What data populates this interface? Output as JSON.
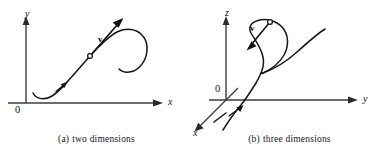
{
  "figure": {
    "background_color": "#ffffff",
    "ink_color": "#1a1a1a",
    "axis_color": "#3a3a3a"
  },
  "panels": [
    {
      "id": "two-dimensions",
      "caption_tag": "(a)",
      "caption_text": "two dimensions",
      "axes": [
        {
          "name": "y-axis",
          "label": "y"
        },
        {
          "name": "x-axis",
          "label": "x"
        }
      ],
      "origin_label": "0",
      "vector_label": "v",
      "point_marker": "open-circle",
      "curve_description": "space curve with tangent vector"
    },
    {
      "id": "three-dimensions",
      "caption_tag": "(b)",
      "caption_text": "three dimensions",
      "axes": [
        {
          "name": "z-axis",
          "label": "z"
        },
        {
          "name": "y-axis",
          "label": "y"
        },
        {
          "name": "x-axis",
          "label": "x"
        }
      ],
      "origin_label": "0",
      "vector_label": "v",
      "point_marker": "open-circle",
      "curve_description": "looping space curve with tangent vector"
    }
  ]
}
